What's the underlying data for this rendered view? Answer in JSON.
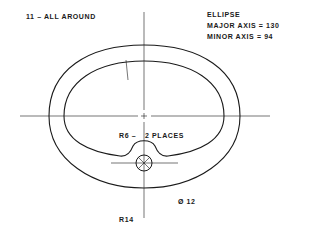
{
  "drawing": {
    "title": "Elliptical ring part drawing",
    "annotations": {
      "wall_thickness": "11 – ALL AROUND",
      "ellipse_title": "ELLIPSE",
      "major_axis": "MAJOR AXIS = 130",
      "minor_axis": "MINOR  AXIS =  94",
      "fillet_radius": "R6 –",
      "fillet_places": "2 PLACES",
      "hole_diameter": "Ø 12",
      "boss_radius": "R14"
    },
    "dimensions": {
      "wall_thickness": 11,
      "major_axis": 130,
      "minor_axis": 94,
      "fillet_radius": 6,
      "fillet_count": 2,
      "hole_diameter": 12,
      "boss_radius": 14
    },
    "colors": {
      "line": "#1a1a1a",
      "background": "#ffffff"
    }
  }
}
